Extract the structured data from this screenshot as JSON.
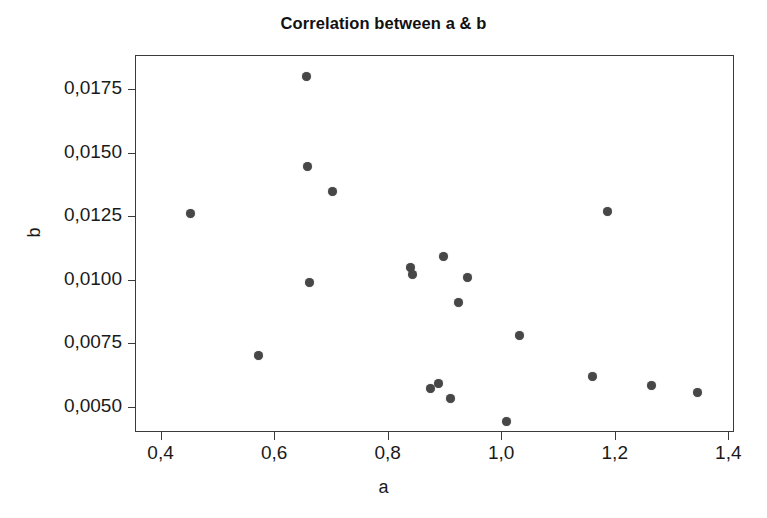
{
  "chart": {
    "title": "Correlation between a & b",
    "xlabel": "a",
    "ylabel": "b",
    "point_color": "#474747",
    "axis_color": "#3a3a3a",
    "background": "#ffffff"
  },
  "chart_data": {
    "type": "scatter",
    "title": "Correlation between a & b",
    "xlabel": "a",
    "ylabel": "b",
    "xlim": [
      0.355,
      1.41
    ],
    "ylim": [
      0.004,
      0.01885
    ],
    "grid": false,
    "legend": null,
    "decimal_separator": ",",
    "xticks": [
      0.4,
      0.6,
      0.8,
      1.0,
      1.2,
      1.4
    ],
    "xtick_labels": [
      "0,4",
      "0,6",
      "0,8",
      "1,0",
      "1,2",
      "1,4"
    ],
    "yticks": [
      0.005,
      0.0075,
      0.01,
      0.0125,
      0.015,
      0.0175
    ],
    "ytick_labels": [
      "0,0050",
      "0,0075",
      "0,0100",
      "0,0125",
      "0,0150",
      "0,0175"
    ],
    "series": [
      {
        "name": "a vs b",
        "marker": "filled-circle",
        "color": "#474747",
        "points": [
          {
            "x": 0.452,
            "y": 0.01262
          },
          {
            "x": 0.573,
            "y": 0.00702
          },
          {
            "x": 0.657,
            "y": 0.018
          },
          {
            "x": 0.659,
            "y": 0.01447
          },
          {
            "x": 0.663,
            "y": 0.0099
          },
          {
            "x": 0.703,
            "y": 0.01348
          },
          {
            "x": 0.84,
            "y": 0.01048
          },
          {
            "x": 0.843,
            "y": 0.01022
          },
          {
            "x": 0.876,
            "y": 0.00572
          },
          {
            "x": 0.889,
            "y": 0.0059
          },
          {
            "x": 0.898,
            "y": 0.0109
          },
          {
            "x": 0.911,
            "y": 0.00533
          },
          {
            "x": 0.925,
            "y": 0.00912
          },
          {
            "x": 0.941,
            "y": 0.0101
          },
          {
            "x": 1.01,
            "y": 0.0044
          },
          {
            "x": 1.032,
            "y": 0.0078
          },
          {
            "x": 1.16,
            "y": 0.00618
          },
          {
            "x": 1.188,
            "y": 0.01268
          },
          {
            "x": 1.265,
            "y": 0.00583
          },
          {
            "x": 1.345,
            "y": 0.00555
          }
        ]
      }
    ]
  }
}
